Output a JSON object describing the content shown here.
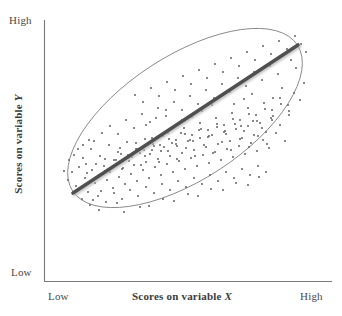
{
  "figure": {
    "kind": "scatterplot",
    "background_color": "#ffffff"
  },
  "axes": {
    "line_color": "#7a7a7a",
    "x": {
      "title": "Scores on variable ",
      "title_variable": "X",
      "low_label": "Low",
      "high_label": "High"
    },
    "y": {
      "title": "Scores on variable ",
      "title_variable": "Y",
      "low_label": "Low",
      "high_label": "High"
    }
  },
  "chart_data": {
    "type": "scatter",
    "title": "",
    "xlabel": "Scores on variable X",
    "ylabel": "Scores on variable Y",
    "xlim": [
      0,
      100
    ],
    "ylim": [
      0,
      100
    ],
    "xtick_labels": [
      "Low",
      "High"
    ],
    "ytick_labels": [
      "Low",
      "High"
    ],
    "grid": false,
    "legend": false,
    "relationship": "strong positive linear correlation",
    "point_color": "#6e6e6e",
    "point_size_px": 1.8,
    "regression_line": {
      "color": "#4f4f4f",
      "width_px": 3.6,
      "x1": 73,
      "y1": 193,
      "x2": 298,
      "y2": 45
    },
    "ellipse": {
      "stroke": "#8a8a8a",
      "stroke_width_px": 0.9,
      "center_x": 185,
      "center_y": 118,
      "radius_x": 134,
      "radius_y": 62,
      "rotation_deg": -33
    },
    "points": [
      [
        76,
        186
      ],
      [
        85,
        178
      ],
      [
        88,
        192
      ],
      [
        92,
        170
      ],
      [
        95,
        183
      ],
      [
        99,
        175
      ],
      [
        101,
        191
      ],
      [
        104,
        166
      ],
      [
        107,
        180
      ],
      [
        110,
        172
      ],
      [
        113,
        188
      ],
      [
        116,
        160
      ],
      [
        119,
        177
      ],
      [
        122,
        169
      ],
      [
        125,
        184
      ],
      [
        128,
        158
      ],
      [
        131,
        174
      ],
      [
        134,
        165
      ],
      [
        137,
        181
      ],
      [
        140,
        153
      ],
      [
        143,
        170
      ],
      [
        146,
        162
      ],
      [
        149,
        178
      ],
      [
        152,
        150
      ],
      [
        155,
        167
      ],
      [
        158,
        159
      ],
      [
        161,
        175
      ],
      [
        164,
        147
      ],
      [
        167,
        164
      ],
      [
        170,
        156
      ],
      [
        173,
        172
      ],
      [
        176,
        144
      ],
      [
        179,
        161
      ],
      [
        182,
        153
      ],
      [
        185,
        169
      ],
      [
        188,
        141
      ],
      [
        191,
        158
      ],
      [
        194,
        150
      ],
      [
        197,
        166
      ],
      [
        200,
        138
      ],
      [
        203,
        155
      ],
      [
        206,
        147
      ],
      [
        209,
        163
      ],
      [
        212,
        135
      ],
      [
        215,
        152
      ],
      [
        218,
        144
      ],
      [
        221,
        160
      ],
      [
        224,
        132
      ],
      [
        227,
        149
      ],
      [
        230,
        141
      ],
      [
        233,
        157
      ],
      [
        236,
        129
      ],
      [
        239,
        146
      ],
      [
        242,
        138
      ],
      [
        245,
        154
      ],
      [
        248,
        126
      ],
      [
        251,
        143
      ],
      [
        254,
        135
      ],
      [
        257,
        151
      ],
      [
        260,
        123
      ],
      [
        263,
        140
      ],
      [
        266,
        132
      ],
      [
        269,
        148
      ],
      [
        272,
        120
      ],
      [
        79,
        167
      ],
      [
        83,
        158
      ],
      [
        87,
        173
      ],
      [
        91,
        149
      ],
      [
        96,
        164
      ],
      [
        100,
        156
      ],
      [
        105,
        171
      ],
      [
        109,
        145
      ],
      [
        114,
        160
      ],
      [
        118,
        152
      ],
      [
        123,
        168
      ],
      [
        127,
        142
      ],
      [
        132,
        157
      ],
      [
        136,
        149
      ],
      [
        141,
        165
      ],
      [
        145,
        139
      ],
      [
        150,
        154
      ],
      [
        154,
        146
      ],
      [
        159,
        162
      ],
      [
        163,
        136
      ],
      [
        168,
        151
      ],
      [
        172,
        143
      ],
      [
        177,
        159
      ],
      [
        181,
        133
      ],
      [
        186,
        148
      ],
      [
        190,
        140
      ],
      [
        195,
        156
      ],
      [
        199,
        130
      ],
      [
        204,
        145
      ],
      [
        208,
        137
      ],
      [
        213,
        153
      ],
      [
        217,
        127
      ],
      [
        222,
        142
      ],
      [
        226,
        134
      ],
      [
        231,
        150
      ],
      [
        235,
        124
      ],
      [
        240,
        139
      ],
      [
        244,
        131
      ],
      [
        249,
        147
      ],
      [
        253,
        121
      ],
      [
        258,
        136
      ],
      [
        262,
        128
      ],
      [
        267,
        144
      ],
      [
        271,
        118
      ],
      [
        276,
        133
      ],
      [
        280,
        125
      ],
      [
        285,
        141
      ],
      [
        289,
        115
      ],
      [
        82,
        199
      ],
      [
        90,
        205
      ],
      [
        98,
        196
      ],
      [
        106,
        202
      ],
      [
        114,
        193
      ],
      [
        122,
        199
      ],
      [
        130,
        190
      ],
      [
        138,
        196
      ],
      [
        146,
        187
      ],
      [
        154,
        193
      ],
      [
        162,
        184
      ],
      [
        170,
        190
      ],
      [
        178,
        181
      ],
      [
        186,
        187
      ],
      [
        194,
        178
      ],
      [
        202,
        184
      ],
      [
        210,
        175
      ],
      [
        218,
        181
      ],
      [
        226,
        172
      ],
      [
        234,
        178
      ],
      [
        242,
        169
      ],
      [
        250,
        175
      ],
      [
        258,
        166
      ],
      [
        266,
        172
      ],
      [
        94,
        141
      ],
      [
        102,
        133
      ],
      [
        110,
        126
      ],
      [
        118,
        134
      ],
      [
        126,
        120
      ],
      [
        134,
        128
      ],
      [
        142,
        114
      ],
      [
        150,
        122
      ],
      [
        158,
        108
      ],
      [
        166,
        116
      ],
      [
        174,
        102
      ],
      [
        182,
        110
      ],
      [
        190,
        96
      ],
      [
        198,
        104
      ],
      [
        206,
        90
      ],
      [
        214,
        98
      ],
      [
        222,
        84
      ],
      [
        230,
        92
      ],
      [
        238,
        78
      ],
      [
        246,
        86
      ],
      [
        254,
        72
      ],
      [
        262,
        80
      ],
      [
        270,
        66
      ],
      [
        278,
        74
      ],
      [
        120,
        148
      ],
      [
        128,
        155
      ],
      [
        136,
        143
      ],
      [
        144,
        150
      ],
      [
        152,
        138
      ],
      [
        160,
        145
      ],
      [
        168,
        133
      ],
      [
        176,
        140
      ],
      [
        184,
        128
      ],
      [
        192,
        135
      ],
      [
        200,
        123
      ],
      [
        208,
        130
      ],
      [
        216,
        118
      ],
      [
        224,
        125
      ],
      [
        232,
        113
      ],
      [
        240,
        120
      ],
      [
        248,
        108
      ],
      [
        256,
        115
      ],
      [
        264,
        103
      ],
      [
        272,
        110
      ],
      [
        280,
        98
      ],
      [
        288,
        105
      ],
      [
        294,
        93
      ],
      [
        300,
        100
      ],
      [
        135,
        95
      ],
      [
        143,
        102
      ],
      [
        151,
        88
      ],
      [
        159,
        96
      ],
      [
        167,
        82
      ],
      [
        175,
        90
      ],
      [
        183,
        76
      ],
      [
        191,
        84
      ],
      [
        199,
        70
      ],
      [
        207,
        78
      ],
      [
        215,
        64
      ],
      [
        223,
        72
      ],
      [
        231,
        58
      ],
      [
        239,
        66
      ],
      [
        247,
        52
      ],
      [
        255,
        60
      ],
      [
        263,
        46
      ],
      [
        271,
        54
      ],
      [
        279,
        41
      ],
      [
        287,
        49
      ],
      [
        295,
        36
      ],
      [
        301,
        44
      ],
      [
        291,
        60
      ],
      [
        283,
        56
      ],
      [
        105,
        159
      ],
      [
        113,
        166
      ],
      [
        121,
        154
      ],
      [
        129,
        161
      ],
      [
        137,
        149
      ],
      [
        145,
        156
      ],
      [
        153,
        144
      ],
      [
        161,
        151
      ],
      [
        169,
        139
      ],
      [
        177,
        146
      ],
      [
        185,
        134
      ],
      [
        193,
        141
      ],
      [
        201,
        129
      ],
      [
        209,
        136
      ],
      [
        217,
        124
      ],
      [
        225,
        131
      ],
      [
        233,
        119
      ],
      [
        241,
        126
      ],
      [
        249,
        114
      ],
      [
        257,
        121
      ],
      [
        265,
        109
      ],
      [
        273,
        116
      ],
      [
        281,
        104
      ],
      [
        289,
        111
      ],
      [
        68,
        180
      ],
      [
        72,
        172
      ],
      [
        80,
        188
      ],
      [
        86,
        164
      ],
      [
        93,
        200
      ],
      [
        117,
        203
      ],
      [
        140,
        207
      ],
      [
        163,
        199
      ],
      [
        188,
        194
      ],
      [
        211,
        189
      ],
      [
        236,
        183
      ],
      [
        259,
        177
      ],
      [
        282,
        88
      ],
      [
        296,
        68
      ],
      [
        304,
        83
      ],
      [
        306,
        52
      ],
      [
        99,
        210
      ],
      [
        124,
        212
      ],
      [
        149,
        206
      ],
      [
        174,
        201
      ],
      [
        198,
        196
      ],
      [
        223,
        190
      ],
      [
        248,
        185
      ],
      [
        273,
        98
      ],
      [
        64,
        171
      ],
      [
        69,
        160
      ],
      [
        74,
        155
      ],
      [
        78,
        149
      ],
      [
        83,
        145
      ],
      [
        89,
        140
      ],
      [
        146,
        125
      ],
      [
        156,
        118
      ],
      [
        166,
        110
      ],
      [
        202,
        111
      ],
      [
        212,
        105
      ],
      [
        244,
        99
      ],
      [
        252,
        94
      ],
      [
        234,
        104
      ],
      [
        192,
        117
      ],
      [
        182,
        120
      ]
    ]
  }
}
